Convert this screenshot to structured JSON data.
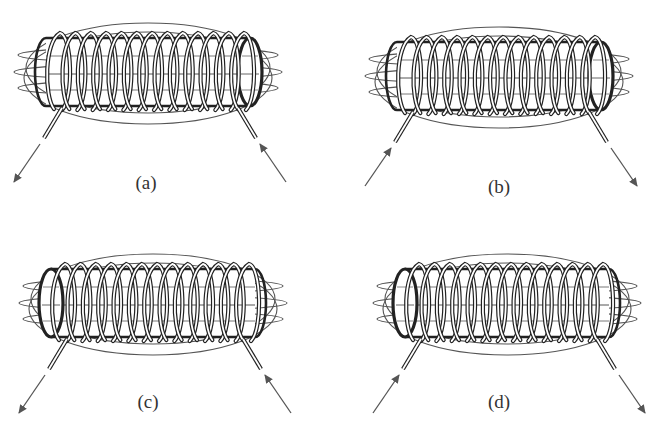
{
  "figure": {
    "turns_per_coil": 13,
    "colors": {
      "line": "#555555",
      "coil": "#222222",
      "arrow": "#555555",
      "background": "#ffffff"
    }
  },
  "panels": [
    {
      "id": "a",
      "label": "(a)",
      "open_end": "right",
      "current_left": "out",
      "current_right": "in"
    },
    {
      "id": "b",
      "label": "(b)",
      "open_end": "right",
      "current_left": "in",
      "current_right": "out"
    },
    {
      "id": "c",
      "label": "(c)",
      "open_end": "left",
      "current_left": "out",
      "current_right": "in"
    },
    {
      "id": "d",
      "label": "(d)",
      "open_end": "left",
      "current_left": "in",
      "current_right": "out"
    }
  ]
}
